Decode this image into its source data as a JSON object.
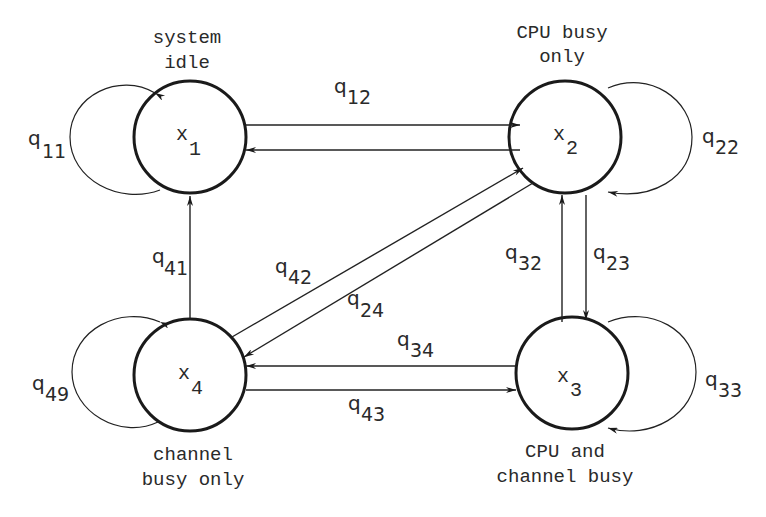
{
  "diagram": {
    "type": "state-transition-diagram",
    "states": [
      {
        "id": "x1",
        "symbol": "x",
        "index": "1",
        "caption_lines": [
          "system",
          "idle"
        ]
      },
      {
        "id": "x2",
        "symbol": "x",
        "index": "2",
        "caption_lines": [
          "CPU busy",
          "only"
        ]
      },
      {
        "id": "x3",
        "symbol": "x",
        "index": "3",
        "caption_lines": [
          "CPU and",
          "channel busy"
        ]
      },
      {
        "id": "x4",
        "symbol": "x",
        "index": "4",
        "caption_lines": [
          "channel",
          "busy only"
        ]
      }
    ],
    "transitions": [
      {
        "from": "x1",
        "to": "x1",
        "symbol": "q",
        "index": "11"
      },
      {
        "from": "x1",
        "to": "x2",
        "symbol": "q",
        "index": "12"
      },
      {
        "from": "x2",
        "to": "x1",
        "symbol": "q",
        "index": ""
      },
      {
        "from": "x2",
        "to": "x2",
        "symbol": "q",
        "index": "22"
      },
      {
        "from": "x2",
        "to": "x3",
        "symbol": "q",
        "index": "23"
      },
      {
        "from": "x3",
        "to": "x2",
        "symbol": "q",
        "index": "32"
      },
      {
        "from": "x3",
        "to": "x3",
        "symbol": "q",
        "index": "33"
      },
      {
        "from": "x3",
        "to": "x4",
        "symbol": "q",
        "index": "34"
      },
      {
        "from": "x4",
        "to": "x3",
        "symbol": "q",
        "index": "43"
      },
      {
        "from": "x4",
        "to": "x1",
        "symbol": "q",
        "index": "41"
      },
      {
        "from": "x4",
        "to": "x2",
        "symbol": "q",
        "index": "42"
      },
      {
        "from": "x2",
        "to": "x4",
        "symbol": "q",
        "index": "24"
      },
      {
        "from": "x4",
        "to": "x4",
        "symbol": "q",
        "index": "49"
      }
    ]
  },
  "labels": {
    "x1_caption_1": "system",
    "x1_caption_2": "idle",
    "x2_caption_1": "CPU busy",
    "x2_caption_2": "only",
    "x3_caption_1": "CPU and",
    "x3_caption_2": "channel busy",
    "x4_caption_1": "channel",
    "x4_caption_2": "busy only",
    "x": "x",
    "q": "q",
    "n1": "1",
    "n2": "2",
    "n3": "3",
    "n4": "4",
    "q11": "11",
    "q12": "12",
    "q22": "22",
    "q23": "23",
    "q32": "32",
    "q33": "33",
    "q34": "34",
    "q43": "43",
    "q41": "41",
    "q42": "42",
    "q24": "24",
    "q49": "49"
  }
}
